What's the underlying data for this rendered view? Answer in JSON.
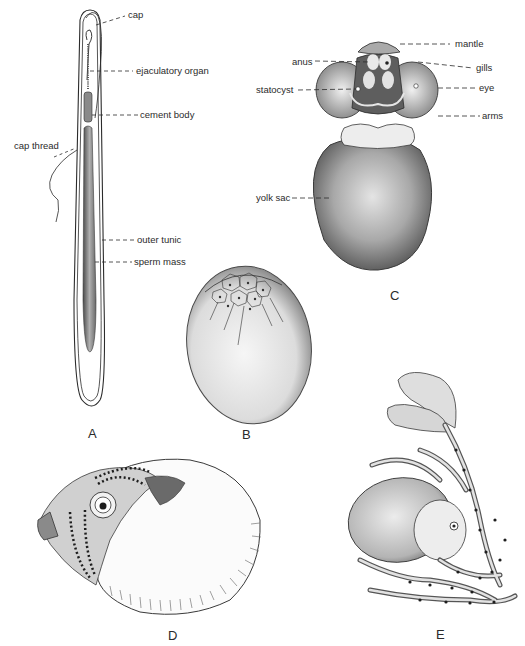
{
  "plate": {
    "figures": [
      {
        "id": "A",
        "letter": "A",
        "labels": {
          "cap": "cap",
          "ejaculatory_organ": "ejaculatory organ",
          "cement_body": "cement body",
          "cap_thread": "cap thread",
          "outer_tunic": "outer tunic",
          "sperm_mass": "sperm mass"
        }
      },
      {
        "id": "B",
        "letter": "B",
        "labels": {}
      },
      {
        "id": "C",
        "letter": "C",
        "labels": {
          "mantle": "mantle",
          "anus": "anus",
          "gills": "gills",
          "statocyst": "statocyst",
          "eye": "eye",
          "arms": "arms",
          "yolk_sac": "yolk sac"
        }
      },
      {
        "id": "D",
        "letter": "D",
        "labels": {}
      },
      {
        "id": "E",
        "letter": "E",
        "labels": {}
      }
    ],
    "colors": {
      "ink": "#2b2b2b",
      "shade_dark": "#5a5a5a",
      "shade_mid": "#9a9a9a",
      "shade_light": "#d8d8d8",
      "paper": "#ffffff"
    }
  }
}
